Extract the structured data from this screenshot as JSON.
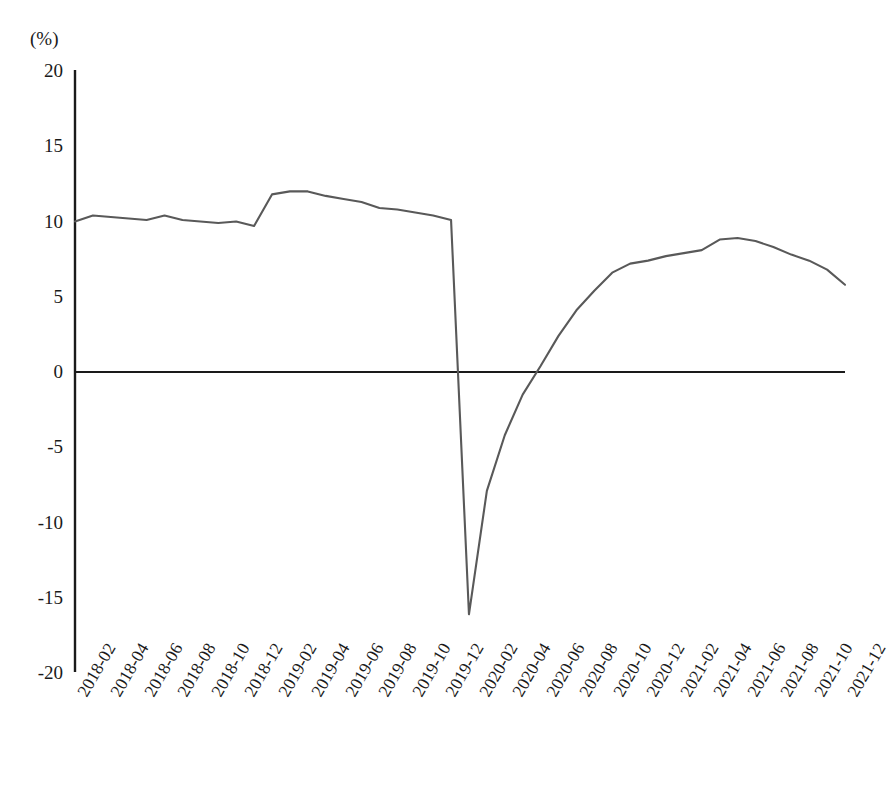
{
  "chart_data": {
    "type": "line",
    "title": "",
    "subtitle": "",
    "xlabel": "",
    "ylabel": "",
    "unit_label": "(%)",
    "ylim": [
      -20,
      20
    ],
    "ytick_values": [
      20,
      15,
      10,
      5,
      0,
      -5,
      -10,
      -15,
      -20
    ],
    "ytick_labels": [
      "20",
      "15",
      "10",
      "5",
      "0",
      "-5",
      "-10",
      "-15",
      "-20"
    ],
    "grid": false,
    "legend": null,
    "legend_position": "none",
    "zero_line": true,
    "line_color": "#595959",
    "axis_color": "#1a1a1a",
    "xtick_labels": [
      "2018-02",
      "2018-04",
      "2018-06",
      "2018-08",
      "2018-10",
      "2018-12",
      "2019-02",
      "2019-04",
      "2019-06",
      "2019-08",
      "2019-10",
      "2019-12",
      "2020-02",
      "2020-04",
      "2020-06",
      "2020-08",
      "2020-10",
      "2020-12",
      "2021-02",
      "2021-04",
      "2021-06",
      "2021-08",
      "2021-10",
      "2021-12"
    ],
    "x": [
      "2018-02",
      "2018-03",
      "2018-04",
      "2018-05",
      "2018-06",
      "2018-07",
      "2018-08",
      "2018-09",
      "2018-10",
      "2018-11",
      "2018-12",
      "2019-02",
      "2019-03",
      "2019-04",
      "2019-05",
      "2019-06",
      "2019-07",
      "2019-08",
      "2019-09",
      "2019-10",
      "2019-11",
      "2019-12",
      "2020-02",
      "2020-03",
      "2020-04",
      "2020-05",
      "2020-06",
      "2020-07",
      "2020-08",
      "2020-09",
      "2020-10",
      "2020-11",
      "2020-12",
      "2021-02",
      "2021-03",
      "2021-04",
      "2021-05",
      "2021-06",
      "2021-07",
      "2021-08",
      "2021-09",
      "2021-10",
      "2021-11",
      "2021-12"
    ],
    "values": [
      10.0,
      10.4,
      10.3,
      10.2,
      10.1,
      10.4,
      10.1,
      10.0,
      9.9,
      10.0,
      9.7,
      11.8,
      12.0,
      12.0,
      11.7,
      11.5,
      11.3,
      10.9,
      10.8,
      10.6,
      10.4,
      10.1,
      -16.1,
      -7.9,
      -4.2,
      -1.5,
      0.4,
      2.4,
      4.1,
      5.4,
      6.6,
      7.2,
      7.4,
      7.7,
      7.9,
      8.1,
      8.8,
      8.9,
      8.7,
      8.3,
      7.8,
      7.4,
      6.8,
      5.8
    ],
    "annotations": []
  },
  "geometry": {
    "plot_left": 75,
    "plot_right": 845,
    "plot_top": 70,
    "plot_bottom": 672,
    "y_zero_px": 372,
    "px_per_unit": 15.05
  }
}
